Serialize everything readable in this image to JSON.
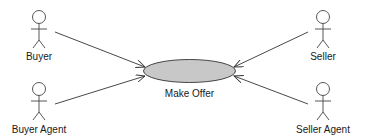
{
  "diagram": {
    "type": "use-case",
    "use_case": {
      "label": "Make Offer",
      "fill": "#c8c8c8",
      "stroke": "#333333"
    },
    "actors": [
      {
        "id": "buyer",
        "label": "Buyer"
      },
      {
        "id": "buyer-agent",
        "label": "Buyer Agent"
      },
      {
        "id": "seller",
        "label": "Seller"
      },
      {
        "id": "seller-agent",
        "label": "Seller Agent"
      }
    ],
    "associations": [
      {
        "from": "Buyer",
        "to": "Make Offer"
      },
      {
        "from": "Buyer Agent",
        "to": "Make Offer"
      },
      {
        "from": "Seller",
        "to": "Make Offer"
      },
      {
        "from": "Seller Agent",
        "to": "Make Offer"
      }
    ]
  }
}
